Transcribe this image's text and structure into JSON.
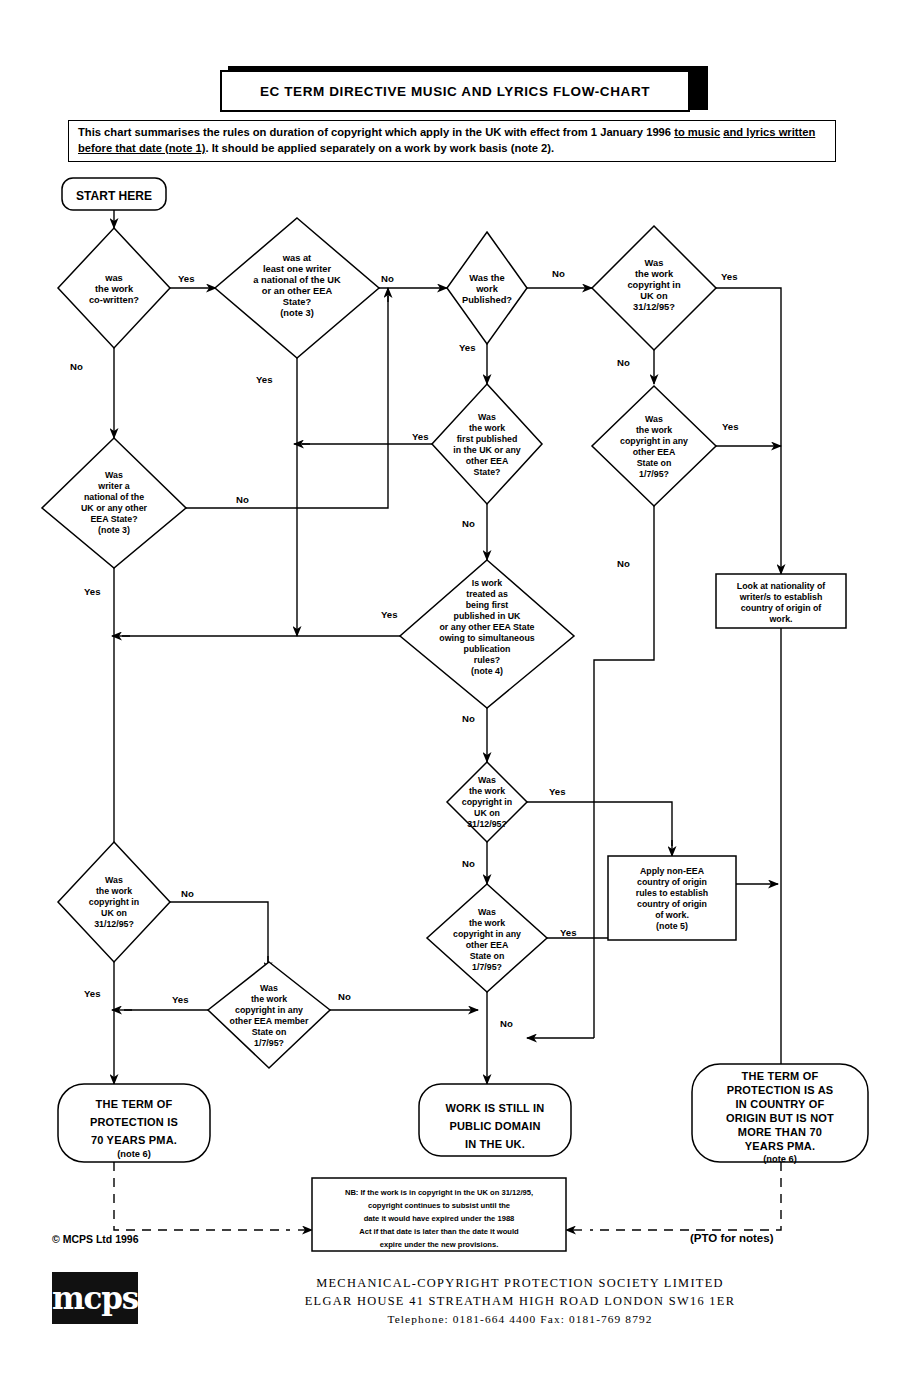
{
  "header": {
    "title": "EC TERM DIRECTIVE MUSIC AND LYRICS FLOW-CHART",
    "summary_line1_a": "This chart summarises the rules on duration of copyright which apply in the UK with effect from 1 January 1996 ",
    "summary_line1_u": "to music",
    "summary_line2_u": "and lyrics written before that date (note 1)",
    "summary_line2_b": ".  It should be applied separately on a work by work basis (note 2)."
  },
  "start": {
    "label": "START HERE"
  },
  "nodes": {
    "d1": [
      "was",
      "the work",
      "co-written?"
    ],
    "d2": [
      "was at",
      "least one writer",
      "a national of the UK",
      "or an other EEA",
      "State?",
      "(note 3)"
    ],
    "d3": [
      "Was the",
      "work",
      "Published?"
    ],
    "d4": [
      "Was",
      "the work",
      "copyright in",
      "UK on",
      "31/12/95?"
    ],
    "d5": [
      "Was",
      "the work",
      "first published",
      "in the UK or any",
      "other EEA",
      "State?"
    ],
    "d6": [
      "Was",
      "the work",
      "copyright in any",
      "other EEA",
      "State on",
      "1/7/95?"
    ],
    "d7": [
      "Was",
      "writer a",
      "national of the",
      "UK or any other",
      "EEA State?",
      "(note 3)"
    ],
    "d8": [
      "Is work",
      "treated as",
      "being first",
      "published in UK",
      "or any other EEA State",
      "owing to simultaneous",
      "publication",
      "rules?",
      "(note 4)"
    ],
    "d9": [
      "Was",
      "the work",
      "copyright in",
      "UK on",
      "31/12/95?"
    ],
    "d10": [
      "Was",
      "the work",
      "copyright in any",
      "other EEA",
      "State  on",
      "1/7/95?"
    ],
    "d11": [
      "Was",
      "the work",
      "copyright in",
      "UK on",
      "31/12/95?"
    ],
    "d12": [
      "Was",
      "the work",
      "copyright in any",
      "other EEA member",
      "State  on",
      "1/7/95?"
    ],
    "p1": [
      "Look at nationality of",
      "writer/s to establish",
      "country of origin of",
      "work."
    ],
    "p2": [
      "Apply non-EEA",
      "country of origin",
      "rules to establish",
      "country of origin",
      "of work.",
      "(note 5)"
    ],
    "t1": [
      "THE TERM OF",
      "PROTECTION IS",
      "70 YEARS PMA.",
      "(note 6)"
    ],
    "t2": [
      "WORK IS STILL IN",
      "PUBLIC DOMAIN",
      "IN THE UK."
    ],
    "t3": [
      "THE TERM OF",
      "PROTECTION IS AS",
      "IN COUNTRY OF",
      "ORIGIN BUT IS NOT",
      "MORE THAN 70",
      "YEARS PMA.",
      "(note 6)"
    ],
    "nb": [
      "NB: If the work is in copyright in the UK on 31/12/95,",
      "copyright continues to subsist until the",
      "date it would have expired under the 1988",
      "Act if that date is later than the date it would",
      "expire under the new provisions."
    ]
  },
  "edge_labels": {
    "yes": "Yes",
    "no": "No"
  },
  "footer": {
    "copyright": "© MCPS Ltd 1996",
    "pto": "(PTO for notes)",
    "logo": "mcps",
    "addr1": "MECHANICAL-COPYRIGHT PROTECTION SOCIETY LIMITED",
    "addr2": "ELGAR HOUSE 41 STREATHAM HIGH ROAD  LONDON SW16 1ER",
    "addr3": "Telephone: 0181-664 4400  Fax: 0181-769 8792"
  },
  "colors": {
    "ink": "#000000",
    "paper": "#ffffff"
  }
}
